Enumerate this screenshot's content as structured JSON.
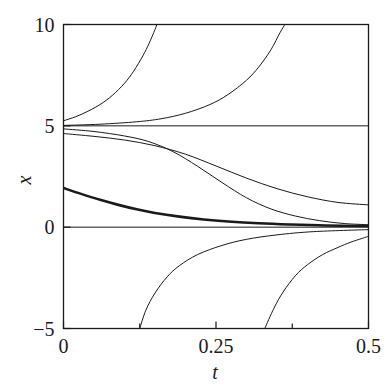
{
  "chart_data": {
    "type": "line",
    "title": "",
    "subtitle": "",
    "xlabel": "t",
    "ylabel": "x",
    "xlim": [
      0,
      0.5
    ],
    "ylim": [
      -5,
      10
    ],
    "grid": false,
    "legend": null,
    "x_ticks": [
      {
        "value": 0,
        "label": "0",
        "major": true
      },
      {
        "value": 0.125,
        "label": "",
        "major": false
      },
      {
        "value": 0.25,
        "label": "0.25",
        "major": true
      },
      {
        "value": 0.375,
        "label": "",
        "major": false
      },
      {
        "value": 0.5,
        "label": "0.5",
        "major": true
      }
    ],
    "y_ticks": [
      {
        "value": -5,
        "label": "-5",
        "major": true
      },
      {
        "value": 0,
        "label": "0",
        "major": true
      },
      {
        "value": 5,
        "label": "5",
        "major": true
      },
      {
        "value": 10,
        "label": "10",
        "major": true
      }
    ],
    "equilibria": [
      {
        "x": 5,
        "kind": "stable",
        "style": "thin-horizontal-line"
      },
      {
        "x": 0,
        "kind": "stable",
        "style": "thin-horizontal-line"
      }
    ],
    "series": [
      {
        "name": "equilibrium-x-5",
        "emphasis": "normal",
        "points": [
          [
            0,
            5
          ],
          [
            0.5,
            5
          ]
        ]
      },
      {
        "name": "equilibrium-x-0",
        "emphasis": "normal",
        "points": [
          [
            0,
            0
          ],
          [
            0.5,
            0
          ]
        ]
      },
      {
        "name": "upper-divergent-A",
        "emphasis": "normal",
        "points": [
          [
            0,
            5.25
          ],
          [
            0.02,
            5.45
          ],
          [
            0.04,
            5.72
          ],
          [
            0.06,
            6.05
          ],
          [
            0.08,
            6.5
          ],
          [
            0.1,
            7.1
          ],
          [
            0.115,
            7.7
          ],
          [
            0.13,
            8.45
          ],
          [
            0.14,
            9.05
          ],
          [
            0.15,
            9.75
          ],
          [
            0.153,
            10.0
          ]
        ]
      },
      {
        "name": "upper-divergent-B",
        "emphasis": "normal",
        "points": [
          [
            0,
            5.02
          ],
          [
            0.06,
            5.08
          ],
          [
            0.12,
            5.2
          ],
          [
            0.16,
            5.35
          ],
          [
            0.2,
            5.62
          ],
          [
            0.24,
            6.05
          ],
          [
            0.27,
            6.55
          ],
          [
            0.3,
            7.25
          ],
          [
            0.32,
            7.9
          ],
          [
            0.34,
            8.75
          ],
          [
            0.355,
            9.6
          ],
          [
            0.363,
            10.0
          ]
        ]
      },
      {
        "name": "upper-convergent-to-5",
        "emphasis": "normal",
        "points": [
          [
            0,
            4.62
          ],
          [
            0.05,
            4.48
          ],
          [
            0.1,
            4.3
          ],
          [
            0.15,
            4.02
          ],
          [
            0.2,
            3.6
          ],
          [
            0.25,
            3.02
          ],
          [
            0.3,
            2.42
          ],
          [
            0.35,
            1.9
          ],
          [
            0.4,
            1.5
          ],
          [
            0.45,
            1.22
          ],
          [
            0.5,
            1.1
          ]
        ]
      },
      {
        "name": "mid-convergent-to-0",
        "emphasis": "normal",
        "points": [
          [
            0,
            4.85
          ],
          [
            0.05,
            4.72
          ],
          [
            0.1,
            4.5
          ],
          [
            0.14,
            4.22
          ],
          [
            0.18,
            3.72
          ],
          [
            0.22,
            3.0
          ],
          [
            0.26,
            2.2
          ],
          [
            0.3,
            1.45
          ],
          [
            0.34,
            0.9
          ],
          [
            0.38,
            0.55
          ],
          [
            0.42,
            0.32
          ],
          [
            0.46,
            0.18
          ],
          [
            0.5,
            0.12
          ]
        ]
      },
      {
        "name": "highlighted-trajectory-to-0",
        "emphasis": "thick",
        "points": [
          [
            0,
            1.93
          ],
          [
            0.03,
            1.63
          ],
          [
            0.06,
            1.35
          ],
          [
            0.09,
            1.1
          ],
          [
            0.12,
            0.88
          ],
          [
            0.15,
            0.7
          ],
          [
            0.19,
            0.52
          ],
          [
            0.23,
            0.38
          ],
          [
            0.27,
            0.28
          ],
          [
            0.32,
            0.19
          ],
          [
            0.37,
            0.13
          ],
          [
            0.43,
            0.08
          ],
          [
            0.5,
            0.06
          ]
        ]
      },
      {
        "name": "lower-divergent-A",
        "emphasis": "normal",
        "points": [
          [
            0.125,
            -5.0
          ],
          [
            0.135,
            -4.1
          ],
          [
            0.15,
            -3.25
          ],
          [
            0.17,
            -2.45
          ],
          [
            0.19,
            -1.9
          ],
          [
            0.22,
            -1.35
          ],
          [
            0.26,
            -0.9
          ],
          [
            0.3,
            -0.6
          ],
          [
            0.35,
            -0.38
          ],
          [
            0.41,
            -0.22
          ],
          [
            0.5,
            -0.12
          ]
        ]
      },
      {
        "name": "lower-divergent-B",
        "emphasis": "normal",
        "points": [
          [
            0.33,
            -5.0
          ],
          [
            0.345,
            -4.0
          ],
          [
            0.36,
            -3.2
          ],
          [
            0.38,
            -2.4
          ],
          [
            0.4,
            -1.85
          ],
          [
            0.425,
            -1.35
          ],
          [
            0.45,
            -1.0
          ],
          [
            0.47,
            -0.75
          ],
          [
            0.49,
            -0.55
          ],
          [
            0.5,
            -0.45
          ]
        ]
      }
    ]
  },
  "axes": {
    "x_title": "t",
    "y_title": "x",
    "x_tick_labels": [
      "0",
      "0.25",
      "0.5"
    ],
    "y_tick_labels": [
      "10",
      "5",
      "0",
      "-5"
    ]
  },
  "style": {
    "background": "#ffffff",
    "frame_color": "#1a1a1a",
    "curve_color": "#1a1a1a",
    "text_color": "#1a1a1a"
  }
}
